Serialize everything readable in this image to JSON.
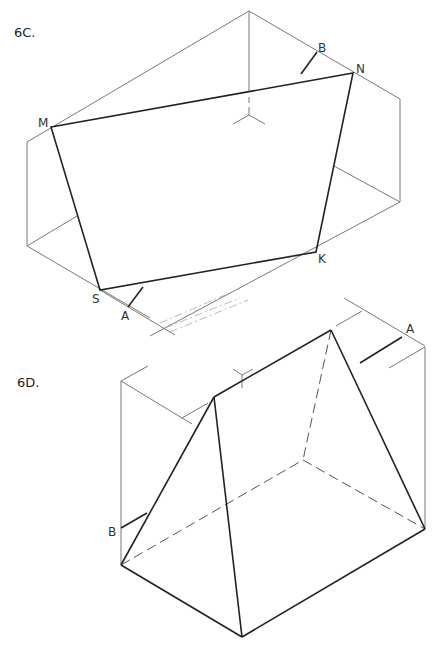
{
  "figures": [
    {
      "id": "6C",
      "label": "6C.",
      "points": {
        "M": "M",
        "N": "N",
        "K": "K",
        "S": "S"
      },
      "markers": {
        "A": "A",
        "B": "B"
      }
    },
    {
      "id": "6D",
      "label": "6D.",
      "markers": {
        "A": "A",
        "B": "B"
      }
    }
  ],
  "colors": {
    "line": "#222222",
    "construction": "#6a6a6a",
    "background": "#ffffff"
  }
}
